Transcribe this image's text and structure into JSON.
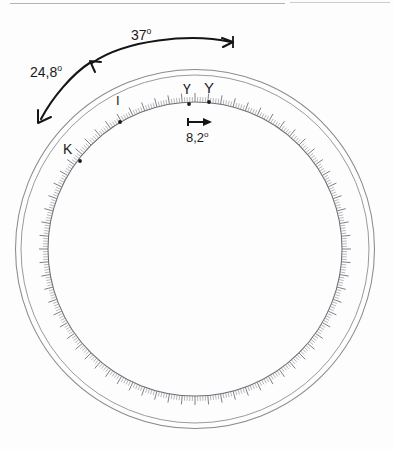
{
  "figure": {
    "type": "technical-drawing",
    "background_color": "#fdfdfd",
    "ink_color": "#1a1a1a",
    "line_color": "#8d8d93",
    "tick_color": "#6f6f75"
  },
  "geometry": {
    "center_x": 195,
    "center_y": 249,
    "outer_ring_radius_1": 179,
    "outer_ring_radius_2": 173,
    "scale_circle_radius": 147,
    "tick_count": 360,
    "minor_tick_length": 5,
    "major_tick_length": 9,
    "major_tick_every": 5
  },
  "scan_artifacts": [
    {
      "name": "top-scan-line-left",
      "x": 10,
      "y": 3,
      "width": 275,
      "color": "#9a9a9a"
    },
    {
      "name": "top-scan-line-right",
      "x": 290,
      "y": 2,
      "width": 100,
      "color": "#b4b4b4"
    }
  ],
  "point_labels": [
    {
      "name": "point-I",
      "text": "I",
      "marker_x": 120,
      "marker_y": 122
    },
    {
      "name": "point-K",
      "text": "K",
      "marker_x": 80,
      "marker_y": 161
    },
    {
      "name": "point-upsilon",
      "text": "Ү",
      "marker_x": 189,
      "marker_y": 104
    },
    {
      "name": "point-Y",
      "text": "Y",
      "marker_x": 209,
      "marker_y": 102
    }
  ],
  "dimensions": [
    {
      "name": "angle-37",
      "value": "37",
      "unit": "o",
      "full_text": "37°",
      "arrow_style": "single-headed arc, arrowhead at right end"
    },
    {
      "name": "angle-24-8",
      "value": "24,8",
      "unit": "o",
      "full_text": "24,8°",
      "arrow_style": "double-headed arc, arrowheads at both ends"
    },
    {
      "name": "angle-8-2",
      "value": "8,2",
      "unit": "o",
      "full_text": "8,2°",
      "arrow_style": "short horizontal double-headed arrow"
    }
  ]
}
